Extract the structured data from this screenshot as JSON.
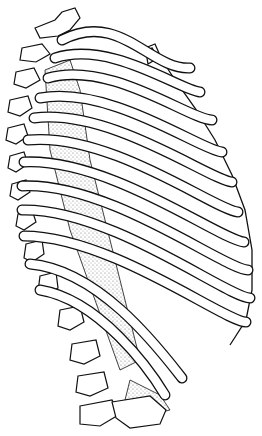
{
  "illustration": {
    "subject": "Human rib cage, lateral-posterior view, line drawing with stippled shading",
    "colors": {
      "background": "#ffffff",
      "ink": "#111111",
      "stipple": "#9a9a9a",
      "bone_fill": "#ffffff"
    },
    "rib_count": 12,
    "ribs": [
      {
        "start": [
          62,
          40
        ],
        "ctrl1": [
          120,
          10
        ],
        "ctrl2": [
          150,
          70
        ],
        "end": [
          190,
          68
        ]
      },
      {
        "start": [
          55,
          58
        ],
        "ctrl1": [
          110,
          40
        ],
        "ctrl2": [
          180,
          90
        ],
        "end": [
          200,
          92
        ]
      },
      {
        "start": [
          48,
          78
        ],
        "ctrl1": [
          110,
          60
        ],
        "ctrl2": [
          190,
          120
        ],
        "end": [
          212,
          120
        ]
      },
      {
        "start": [
          40,
          98
        ],
        "ctrl1": [
          110,
          85
        ],
        "ctrl2": [
          200,
          150
        ],
        "end": [
          222,
          152
        ]
      },
      {
        "start": [
          34,
          118
        ],
        "ctrl1": [
          110,
          108
        ],
        "ctrl2": [
          210,
          180
        ],
        "end": [
          232,
          182
        ]
      },
      {
        "start": [
          28,
          140
        ],
        "ctrl1": [
          110,
          132
        ],
        "ctrl2": [
          215,
          210
        ],
        "end": [
          238,
          212
        ]
      },
      {
        "start": [
          24,
          162
        ],
        "ctrl1": [
          110,
          158
        ],
        "ctrl2": [
          220,
          240
        ],
        "end": [
          244,
          242
        ]
      },
      {
        "start": [
          22,
          186
        ],
        "ctrl1": [
          110,
          182
        ],
        "ctrl2": [
          225,
          270
        ],
        "end": [
          248,
          270
        ]
      },
      {
        "start": [
          22,
          210
        ],
        "ctrl1": [
          110,
          208
        ],
        "ctrl2": [
          228,
          298
        ],
        "end": [
          250,
          298
        ]
      },
      {
        "start": [
          24,
          236
        ],
        "ctrl1": [
          110,
          236
        ],
        "ctrl2": [
          225,
          322
        ],
        "end": [
          246,
          322
        ]
      },
      {
        "start": [
          30,
          264
        ],
        "ctrl1": [
          100,
          270
        ],
        "ctrl2": [
          160,
          350
        ],
        "end": [
          182,
          378
        ]
      },
      {
        "start": [
          40,
          290
        ],
        "ctrl1": [
          100,
          300
        ],
        "ctrl2": [
          150,
          370
        ],
        "end": [
          165,
          395
        ]
      }
    ]
  }
}
